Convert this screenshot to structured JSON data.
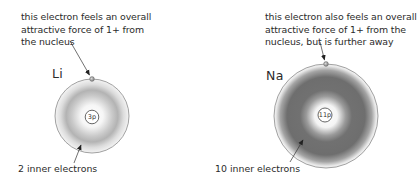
{
  "diagram": {
    "atoms": [
      {
        "element": "Li",
        "nucleus_label": "3p",
        "top_caption": [
          "this electron feels an overall",
          "attractive force of 1+ from",
          "the nucleus"
        ],
        "inner_label": "2 inner electrons",
        "inner_shading": "light",
        "center": [
          92,
          116
        ],
        "outer_radius": 37
      },
      {
        "element": "Na",
        "nucleus_label": "11p",
        "top_caption": [
          "this electron also feels an overall",
          "attractive force of 1+ from the",
          "nucleus, but is further away"
        ],
        "inner_label": "10 inner electrons",
        "inner_shading": "dark",
        "center": [
          326,
          116
        ],
        "outer_radius": 52
      }
    ],
    "colors": {
      "orbit_line": "#8a8a8a",
      "electron_dot": "#9a9a9a",
      "li_cloud": "#b4b4b4",
      "na_cloud": "#6e6e6e",
      "text": "#2b2b2b"
    }
  }
}
